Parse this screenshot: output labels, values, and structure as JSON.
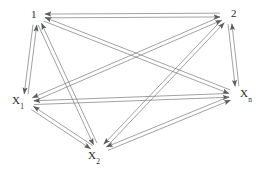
{
  "diagram": {
    "type": "complete-directed-graph",
    "title": "",
    "background_color": "#ffffff",
    "edge_color": "#7a7a7a",
    "edge_color_dark": "#5a5a5a",
    "label_color": "#2b2b2b",
    "edge_style": "double-line-arrow",
    "bidirectional": true,
    "width": 268,
    "height": 172,
    "nodes": [
      {
        "id": "n1",
        "label": "1",
        "sub": "",
        "x": 36,
        "y": 16,
        "label_x": 31,
        "label_y": 9
      },
      {
        "id": "n2",
        "label": "2",
        "sub": "",
        "x": 229,
        "y": 15,
        "label_x": 231,
        "label_y": 8
      },
      {
        "id": "x1",
        "label": "X",
        "sub": "1",
        "x": 25,
        "y": 103,
        "label_x": 12,
        "label_y": 95
      },
      {
        "id": "xn",
        "label": "X",
        "sub": "n",
        "x": 238,
        "y": 95,
        "label_x": 240,
        "label_y": 88
      },
      {
        "id": "x2",
        "label": "X",
        "sub": "2",
        "x": 99,
        "y": 152,
        "label_x": 88,
        "label_y": 150
      }
    ],
    "edges": [
      {
        "from": "n1",
        "to": "n2",
        "directed": "both"
      },
      {
        "from": "n1",
        "to": "x1",
        "directed": "both"
      },
      {
        "from": "n1",
        "to": "xn",
        "directed": "both"
      },
      {
        "from": "n1",
        "to": "x2",
        "directed": "both"
      },
      {
        "from": "n2",
        "to": "x1",
        "directed": "both"
      },
      {
        "from": "n2",
        "to": "xn",
        "directed": "both"
      },
      {
        "from": "n2",
        "to": "x2",
        "directed": "both"
      },
      {
        "from": "x1",
        "to": "xn",
        "directed": "both"
      },
      {
        "from": "x1",
        "to": "x2",
        "directed": "both"
      },
      {
        "from": "x2",
        "to": "xn",
        "directed": "both"
      }
    ],
    "edge_count": 10,
    "node_count": 5
  }
}
